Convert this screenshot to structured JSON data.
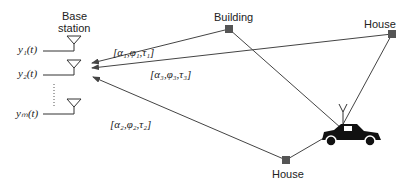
{
  "diagram": {
    "base_station": {
      "label_line1": "Base",
      "label_line2": "station",
      "outputs": [
        "y₁(t)",
        "y₂(t)",
        "yₘ(t)"
      ]
    },
    "scatterers": [
      {
        "label": "Building"
      },
      {
        "label": "House"
      },
      {
        "label": "House"
      }
    ],
    "paths": [
      {
        "label": "[α₁,φ₁,τ₁]"
      },
      {
        "label": "[α₃,φ₃,τ₃]"
      },
      {
        "label": "[α₂,φ₂,τ₂]"
      }
    ],
    "mobile": {
      "icon": "car-icon"
    },
    "colors": {
      "line": "#444444",
      "node": "#555555"
    }
  }
}
